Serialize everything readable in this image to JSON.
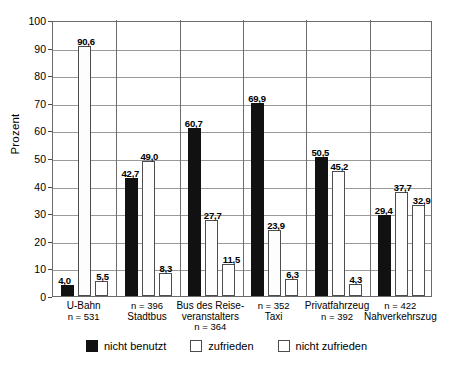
{
  "chart_data": {
    "type": "bar",
    "title": "",
    "xlabel": "",
    "ylabel": "Prozent",
    "ylim": [
      0,
      100
    ],
    "ytick_step": 10,
    "yticks": [
      "100",
      "90",
      "80",
      "70",
      "60",
      "50",
      "40",
      "30",
      "20",
      "10",
      "0"
    ],
    "grid": true,
    "legend_position": "bottom",
    "categories": [
      "U-Bahn",
      "Stadtbus",
      "Bus des Reise-veranstalters",
      "Taxi",
      "Privatfahrzeug",
      "Nahverkehrszug"
    ],
    "category_notes": [
      "n = 531",
      "n = 396",
      "n = 364",
      "n = 352",
      "n = 392",
      "n = 422"
    ],
    "series": [
      {
        "name": "nicht benutzt",
        "values": [
          4.0,
          42.7,
          60.7,
          69.9,
          50.5,
          29.4
        ]
      },
      {
        "name": "zufrieden",
        "values": [
          90.6,
          49.0,
          27.7,
          23.9,
          45.2,
          37.7
        ]
      },
      {
        "name": "nicht zufrieden",
        "values": [
          5.5,
          8.3,
          11.5,
          6.3,
          4.3,
          32.9
        ]
      }
    ],
    "value_labels": {
      "nicht benutzt": [
        "4,0",
        "42,7",
        "60,7",
        "69,9",
        "50,5",
        "29,4"
      ],
      "zufrieden": [
        "90,6",
        "49,0",
        "27,7",
        "23,9",
        "45,2",
        "37,7"
      ],
      "nicht zufrieden": [
        "5,5",
        "8,3",
        "11,5",
        "6,3",
        "4,3",
        "32,9"
      ]
    }
  },
  "axis": {
    "y_title": "Prozent",
    "ticks": [
      "100",
      "90",
      "80",
      "70",
      "60",
      "50",
      "40",
      "30",
      "20",
      "10",
      "0"
    ]
  },
  "groups": [
    {
      "name_line1": "U-Bahn",
      "name_line2": "",
      "n_label": "n = 531",
      "n_first": false,
      "bars": [
        {
          "series": "nicht benutzt",
          "label": "4,0",
          "value": 4.0
        },
        {
          "series": "zufrieden",
          "label": "90,6",
          "value": 90.6
        },
        {
          "series": "nicht zufrieden",
          "label": "5,5",
          "value": 5.5
        }
      ]
    },
    {
      "name_line1": "Stadtbus",
      "name_line2": "",
      "n_label": "n = 396",
      "n_first": true,
      "bars": [
        {
          "series": "nicht benutzt",
          "label": "42,7",
          "value": 42.7
        },
        {
          "series": "zufrieden",
          "label": "49,0",
          "value": 49.0
        },
        {
          "series": "nicht zufrieden",
          "label": "8,3",
          "value": 8.3
        }
      ]
    },
    {
      "name_line1": "Bus des Reise-",
      "name_line2": "veranstalters",
      "n_label": "n = 364",
      "n_first": false,
      "bars": [
        {
          "series": "nicht benutzt",
          "label": "60,7",
          "value": 60.7
        },
        {
          "series": "zufrieden",
          "label": "27,7",
          "value": 27.7
        },
        {
          "series": "nicht zufrieden",
          "label": "11,5",
          "value": 11.5
        }
      ]
    },
    {
      "name_line1": "Taxi",
      "name_line2": "",
      "n_label": "n = 352",
      "n_first": true,
      "bars": [
        {
          "series": "nicht benutzt",
          "label": "69,9",
          "value": 69.9
        },
        {
          "series": "zufrieden",
          "label": "23,9",
          "value": 23.9
        },
        {
          "series": "nicht zufrieden",
          "label": "6,3",
          "value": 6.3
        }
      ]
    },
    {
      "name_line1": "Privatfahrzeug",
      "name_line2": "",
      "n_label": "n = 392",
      "n_first": false,
      "bars": [
        {
          "series": "nicht benutzt",
          "label": "50,5",
          "value": 50.5
        },
        {
          "series": "zufrieden",
          "label": "45,2",
          "value": 45.2
        },
        {
          "series": "nicht zufrieden",
          "label": "4,3",
          "value": 4.3
        }
      ]
    },
    {
      "name_line1": "Nahverkehrszug",
      "name_line2": "",
      "n_label": "n = 422",
      "n_first": true,
      "bars": [
        {
          "series": "nicht benutzt",
          "label": "29,4",
          "value": 29.4
        },
        {
          "series": "zufrieden",
          "label": "37,7",
          "value": 37.7
        },
        {
          "series": "nicht zufrieden",
          "label": "32,9",
          "value": 32.9
        }
      ]
    }
  ],
  "legend": {
    "items": [
      {
        "label": "nicht benutzt",
        "swatch": "filled-black-square",
        "color": "#111111"
      },
      {
        "label": "zufrieden",
        "swatch": "dotted-white-square",
        "color": "#ffffff"
      },
      {
        "label": "nicht zufrieden",
        "swatch": "outlined-white-square",
        "color": "#ffffff"
      }
    ]
  },
  "colors": {
    "nicht_benutzt": "#111111",
    "zufrieden": "#fdfdfd",
    "nicht_zufrieden": "#ffffff",
    "grid": "#9a9a9a",
    "axis": "#6b6b6b",
    "background": "#ffffff"
  }
}
